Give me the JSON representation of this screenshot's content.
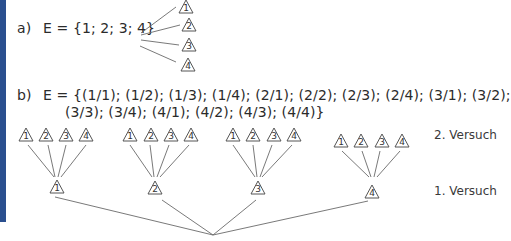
{
  "part_a": {
    "label": "a)",
    "set": "E = {1; 2; 3; 4}",
    "outcomes": [
      "1",
      "2",
      "3",
      "4"
    ]
  },
  "part_b": {
    "label": "b)",
    "set_line1": "E = {(1/1); (1/2); (1/3); (1/4); (2/1); (2/2); (2/3); (2/4); (3/1); (3/2);",
    "set_line2": "(3/3); (3/4); (4/1); (4/2); (4/3); (4/4)}",
    "first_trial_outcomes": [
      "1",
      "2",
      "3",
      "4"
    ],
    "second_trial_outcomes": [
      "1",
      "2",
      "3",
      "4"
    ],
    "level_labels": {
      "second": "2. Versuch",
      "first": "1. Versuch"
    }
  },
  "colors": {
    "side_bar": "#2a4f8f",
    "line": "#6a6a6a",
    "text": "#2b2b2b"
  }
}
